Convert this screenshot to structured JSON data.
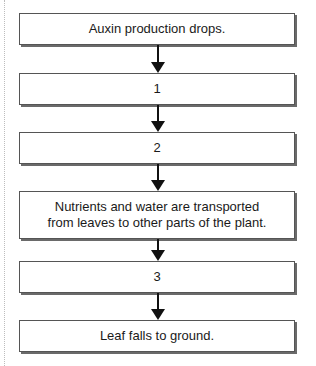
{
  "flowchart": {
    "steps": [
      {
        "label": "Auxin production drops."
      },
      {
        "label": "1"
      },
      {
        "label": "2"
      },
      {
        "label": "Nutrients and water are transported",
        "label2": "from leaves to other parts of the plant."
      },
      {
        "label": "3"
      },
      {
        "label": "Leaf falls to ground."
      }
    ],
    "arrow_color": "#111111",
    "box_border_color": "#555555"
  }
}
